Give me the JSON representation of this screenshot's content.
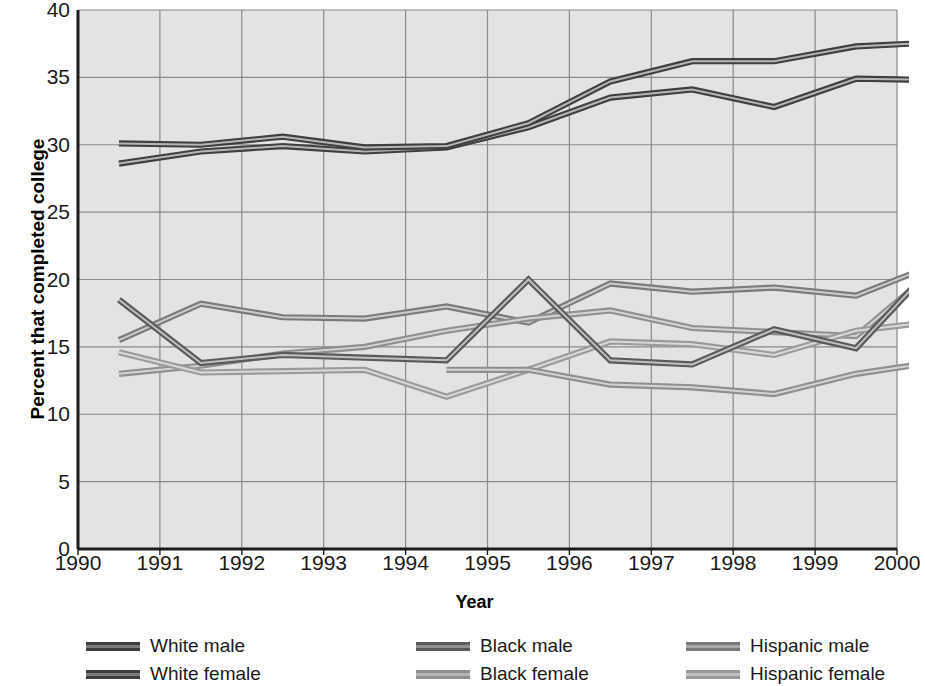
{
  "chart_data": {
    "type": "line",
    "title": "",
    "xlabel": "Year",
    "ylabel": "Percent that completed college",
    "xlim": [
      1990,
      2000
    ],
    "ylim": [
      0,
      40
    ],
    "ytick_step": 5,
    "grid": true,
    "legend_position": "bottom",
    "x_tick_labels": [
      "1990",
      "1991",
      "1992",
      "1993",
      "1994",
      "1995",
      "1996",
      "1997",
      "1998",
      "1999",
      "2000"
    ],
    "y_tick_labels": [
      "40",
      "35",
      "30",
      "25",
      "20",
      "15",
      "10",
      "5",
      "0"
    ],
    "x": [
      1990.5,
      1991.5,
      1992.5,
      1993.5,
      1994.5,
      1995.5,
      1996.5,
      1997.5,
      1998.5,
      1999.5,
      2000.5
    ],
    "series": [
      {
        "name": "White male",
        "color": "#3f3f3f",
        "values": [
          30.1,
          30.0,
          30.6,
          29.8,
          29.9,
          31.6,
          34.7,
          36.2,
          36.2,
          37.3,
          37.6
        ]
      },
      {
        "name": "White female",
        "color": "#3f3f3f",
        "values": [
          28.6,
          29.5,
          29.9,
          29.5,
          29.8,
          31.3,
          33.5,
          34.1,
          32.8,
          34.9,
          34.8
        ]
      },
      {
        "name": "Black male",
        "color": "#5a5a5a",
        "values": [
          18.5,
          13.8,
          14.4,
          14.2,
          14.0,
          20.0,
          14.0,
          13.7,
          16.3,
          14.9,
          21.4
        ]
      },
      {
        "name": "Black female",
        "color": "#8f8f8f",
        "values": [
          13.0,
          13.6,
          14.5,
          15.0,
          16.2,
          17.1,
          17.7,
          16.4,
          16.1,
          15.8,
          20.9
        ]
      },
      {
        "name": "Hispanic male",
        "color": "#7a7a7a",
        "values": [
          15.5,
          18.2,
          17.2,
          17.1,
          18.0,
          16.8,
          19.7,
          19.1,
          19.4,
          18.8,
          21.2
        ]
      },
      {
        "name": "Hispanic female",
        "color": "#9a9a9a",
        "values": [
          14.6,
          13.1,
          13.2,
          13.3,
          11.3,
          13.3,
          15.4,
          15.2,
          14.4,
          16.2,
          16.9
        ]
      }
    ],
    "extra_series": [
      {
        "name": "Black female lower branch",
        "color": "#8f8f8f",
        "values": [
          null,
          null,
          null,
          null,
          13.3,
          13.3,
          12.2,
          12.0,
          11.5,
          13.0,
          13.9
        ]
      }
    ]
  },
  "legend": {
    "items": [
      {
        "label": "White male",
        "color": "#3f3f3f",
        "inner": "#7d7d7d"
      },
      {
        "label": "Black male",
        "color": "#5a5a5a",
        "inner": "#8f8f8f"
      },
      {
        "label": "Hispanic male",
        "color": "#7a7a7a",
        "inner": "#a8a8a8"
      },
      {
        "label": "White female",
        "color": "#3f3f3f",
        "inner": "#7d7d7d"
      },
      {
        "label": "Black female",
        "color": "#8f8f8f",
        "inner": "#b5b5b5"
      },
      {
        "label": "Hispanic female",
        "color": "#9a9a9a",
        "inner": "#c0c0c0"
      }
    ]
  },
  "style": {
    "plot_background": "#e3e3e3",
    "grid_color": "#8a8a8a",
    "axis_color": "#1c1c1c",
    "text_color": "#1a1a1a"
  }
}
